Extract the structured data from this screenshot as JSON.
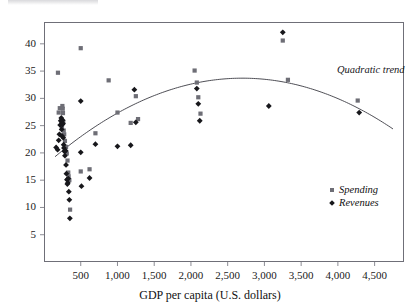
{
  "figure": {
    "xaxis_title": "GDP per capita (U.S. dollars)",
    "trend_annotation": "Quadratic trend"
  },
  "legend": {
    "items": [
      {
        "label": "Spending",
        "marker": "square-marker-icon",
        "color": "#6e6e76"
      },
      {
        "label": "Revenues",
        "marker": "diamond-marker-icon",
        "color": "#17171b"
      }
    ]
  },
  "chart_data": {
    "type": "scatter",
    "title": "",
    "subtitle": "",
    "xlabel": "GDP per capita (U.S. dollars)",
    "ylabel": "",
    "xlim": [
      0,
      4900
    ],
    "ylim": [
      0,
      44
    ],
    "grid": false,
    "legend_position": "inside-bottom-right",
    "xticks": [
      500,
      1000,
      1500,
      2000,
      2500,
      3000,
      3500,
      4000,
      4500
    ],
    "xtick_labels": [
      "500",
      "1,000",
      "1,500",
      "2,000",
      "2,500",
      "3,000",
      "3,500",
      "4,000",
      "4,500"
    ],
    "yticks": [
      5,
      10,
      15,
      20,
      25,
      30,
      35,
      40
    ],
    "ytick_labels": [
      "5",
      "10",
      "15",
      "20",
      "25",
      "30",
      "35",
      "40"
    ],
    "annotations": [
      {
        "text": "Quadratic trend",
        "x": 3750,
        "y": 33.5
      }
    ],
    "series": [
      {
        "name": "Spending",
        "marker": "square",
        "color": "#6e6e76",
        "points": [
          [
            190,
            34.7
          ],
          [
            200,
            27.4
          ],
          [
            215,
            28.2
          ],
          [
            235,
            25.3
          ],
          [
            240,
            25.9
          ],
          [
            245,
            24.6
          ],
          [
            250,
            28.6
          ],
          [
            255,
            28.1
          ],
          [
            258,
            27.3
          ],
          [
            262,
            25.6
          ],
          [
            268,
            24.1
          ],
          [
            275,
            23.4
          ],
          [
            285,
            22.2
          ],
          [
            300,
            21.1
          ],
          [
            310,
            19.9
          ],
          [
            320,
            18.6
          ],
          [
            330,
            16.4
          ],
          [
            335,
            15.7
          ],
          [
            345,
            15.0
          ],
          [
            355,
            9.6
          ],
          [
            500,
            39.2
          ],
          [
            500,
            16.6
          ],
          [
            620,
            17.0
          ],
          [
            700,
            23.6
          ],
          [
            880,
            33.3
          ],
          [
            1000,
            27.4
          ],
          [
            1180,
            25.5
          ],
          [
            1250,
            30.4
          ],
          [
            1280,
            26.2
          ],
          [
            2050,
            35.1
          ],
          [
            2080,
            32.9
          ],
          [
            2100,
            30.2
          ],
          [
            2130,
            27.2
          ],
          [
            3250,
            40.6
          ],
          [
            3320,
            33.4
          ],
          [
            4270,
            29.6
          ]
        ]
      },
      {
        "name": "Revenues",
        "marker": "diamond",
        "color": "#17171b",
        "points": [
          [
            165,
            21.0
          ],
          [
            185,
            20.6
          ],
          [
            200,
            22.3
          ],
          [
            210,
            23.4
          ],
          [
            220,
            25.1
          ],
          [
            228,
            25.9
          ],
          [
            235,
            26.4
          ],
          [
            240,
            24.3
          ],
          [
            245,
            23.1
          ],
          [
            250,
            25.2
          ],
          [
            255,
            26.0
          ],
          [
            258,
            25.4
          ],
          [
            262,
            22.8
          ],
          [
            268,
            21.5
          ],
          [
            272,
            20.9
          ],
          [
            278,
            20.3
          ],
          [
            285,
            19.5
          ],
          [
            295,
            20.4
          ],
          [
            300,
            17.8
          ],
          [
            305,
            16.2
          ],
          [
            312,
            15.1
          ],
          [
            318,
            14.3
          ],
          [
            325,
            14.5
          ],
          [
            330,
            15.3
          ],
          [
            338,
            12.9
          ],
          [
            345,
            11.4
          ],
          [
            352,
            8.0
          ],
          [
            500,
            29.5
          ],
          [
            500,
            20.1
          ],
          [
            510,
            13.9
          ],
          [
            620,
            15.4
          ],
          [
            700,
            21.6
          ],
          [
            1000,
            21.2
          ],
          [
            1180,
            21.4
          ],
          [
            1230,
            31.6
          ],
          [
            1250,
            25.6
          ],
          [
            2080,
            31.8
          ],
          [
            2100,
            29.0
          ],
          [
            2120,
            25.9
          ],
          [
            3060,
            28.6
          ],
          [
            3250,
            42.1
          ],
          [
            4290,
            27.4
          ]
        ]
      }
    ],
    "trend": {
      "name": "Quadratic trend",
      "type": "quadratic",
      "color": "#3a3a42",
      "x_start": 150,
      "x_end": 4750,
      "vertex_x": 2700,
      "vertex_y": 33.7,
      "y_at_x_start": 19.3,
      "y_at_x_end": 30.3
    }
  }
}
